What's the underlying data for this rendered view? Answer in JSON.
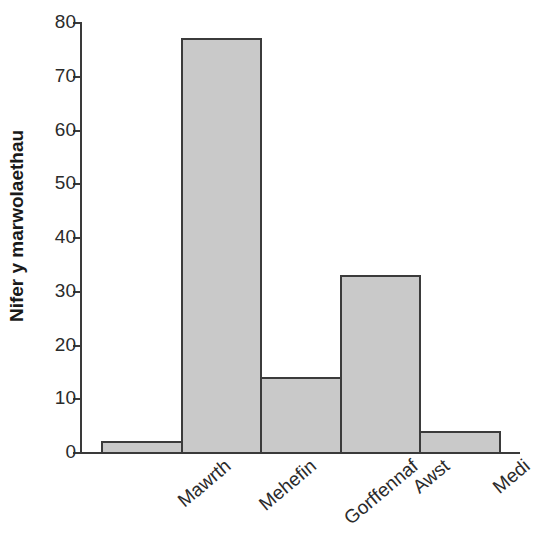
{
  "chart_data": {
    "type": "bar",
    "title": "",
    "xlabel": "",
    "ylabel": "Nifer y marwolaethau",
    "categories": [
      "Mawrth",
      "Mehefin",
      "Gorffennaf",
      "Awst",
      "Medi"
    ],
    "values": [
      2,
      77,
      14,
      33,
      4
    ],
    "ylim": [
      0,
      80
    ],
    "yticks": [
      0,
      10,
      20,
      30,
      40,
      50,
      60,
      70,
      80
    ],
    "ytick_labels": [
      "0",
      "10",
      "20",
      "30",
      "40",
      "50",
      "60",
      "70",
      "80"
    ],
    "grid": false,
    "legend": false,
    "bar_fill_color": "#c9c9c9",
    "bar_edge_color": "#3b3b3b",
    "axis_color": "#3a3a3a",
    "text_color": "#2b2b2b",
    "background_color": "#ffffff",
    "xtick_label_rotation": -40
  },
  "axes": {
    "y_title": "Nifer y marwolaethau"
  }
}
